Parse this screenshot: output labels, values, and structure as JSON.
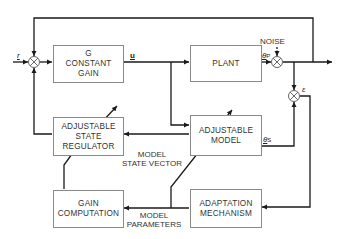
{
  "diagram": {
    "type": "block-diagram",
    "title": "",
    "blocks": {
      "constant_gain": {
        "lines": [
          "G",
          "CONSTANT",
          "GAIN"
        ]
      },
      "plant": {
        "lines": [
          "PLANT"
        ]
      },
      "state_regulator": {
        "lines": [
          "ADJUSTABLE",
          "STATE",
          "REGULATOR"
        ]
      },
      "adjustable_model": {
        "lines": [
          "ADJUSTABLE",
          "MODEL"
        ]
      },
      "gain_computation": {
        "lines": [
          "GAIN",
          "COMPUTATION"
        ]
      },
      "adaptation_mechanism": {
        "lines": [
          "ADAPTATION",
          "MECHANISM"
        ]
      }
    },
    "signals": {
      "reference": "r",
      "control": "u",
      "plant_output": "θ",
      "plant_output_sub": "P",
      "model_output": "θ",
      "model_output_sub": "S",
      "error": "ε",
      "noise": "NOISE"
    },
    "edge_labels": {
      "model_state_vector": [
        "MODEL",
        "STATE VECTOR"
      ],
      "model_parameters": [
        "MODEL",
        "PARAMETERS"
      ]
    },
    "summing_junctions": [
      "input-sum",
      "noise-sum",
      "error-sum"
    ],
    "line_color": "#1a1a1a",
    "box_border_color": "#8a8a8a"
  }
}
